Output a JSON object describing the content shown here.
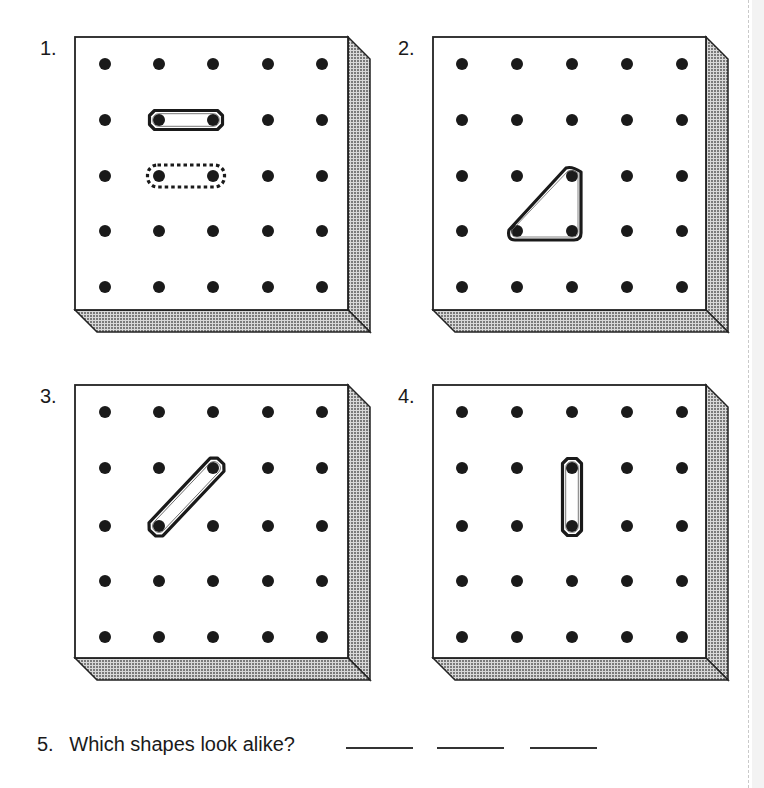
{
  "worksheet": {
    "problems": [
      {
        "number": "1.",
        "label_pos": [
          40,
          38
        ],
        "board_origin": [
          75,
          37
        ],
        "dot_columns": [
          105,
          159,
          213,
          268,
          322
        ],
        "dot_rows": [
          64,
          120,
          176,
          231,
          287
        ],
        "bands": [
          {
            "style": "solid",
            "shape": "segment",
            "pegs": [
              [
                159,
                120
              ],
              [
                213,
                120
              ]
            ]
          },
          {
            "style": "dotted",
            "shape": "segment",
            "pegs": [
              [
                159,
                176
              ],
              [
                213,
                176
              ]
            ]
          }
        ]
      },
      {
        "number": "2.",
        "label_pos": [
          398,
          38
        ],
        "board_origin": [
          433,
          37
        ],
        "dot_columns": [
          462,
          517,
          572,
          627,
          682
        ],
        "dot_rows": [
          64,
          120,
          176,
          231,
          287
        ],
        "bands": [
          {
            "style": "solid",
            "shape": "triangle",
            "pegs": [
              [
                572,
                176
              ],
              [
                517,
                231
              ],
              [
                572,
                231
              ]
            ]
          }
        ]
      },
      {
        "number": "3.",
        "label_pos": [
          40,
          386
        ],
        "board_origin": [
          75,
          385
        ],
        "dot_columns": [
          105,
          159,
          213,
          268,
          322
        ],
        "dot_rows": [
          412,
          468,
          526,
          581,
          637
        ],
        "bands": [
          {
            "style": "solid",
            "shape": "segment",
            "pegs": [
              [
                159,
                526
              ],
              [
                214,
                468
              ]
            ]
          }
        ]
      },
      {
        "number": "4.",
        "label_pos": [
          398,
          386
        ],
        "board_origin": [
          433,
          385
        ],
        "dot_columns": [
          462,
          517,
          572,
          627,
          682
        ],
        "dot_rows": [
          412,
          468,
          526,
          581,
          637
        ],
        "bands": [
          {
            "style": "solid",
            "shape": "segment",
            "pegs": [
              [
                572,
                468
              ],
              [
                572,
                526
              ]
            ]
          }
        ]
      }
    ],
    "question": {
      "number": "5.",
      "text": "Which shapes look alike?",
      "blanks": [
        {
          "x": 346,
          "value": ""
        },
        {
          "x": 437,
          "value": ""
        },
        {
          "x": 530,
          "value": ""
        }
      ]
    },
    "board_style": {
      "face_size": 273,
      "depth": 22,
      "face_color": "#ffffff",
      "edge_color": "#222222",
      "shade_color": "#9a9a9a",
      "peg_color": "#1a1a1a",
      "peg_radius": 6,
      "band_color": "#1a1a1a"
    }
  }
}
